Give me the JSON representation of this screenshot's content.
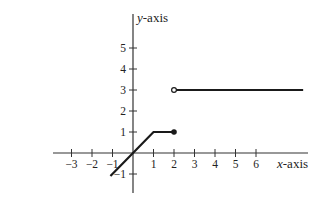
{
  "chart_data": {
    "type": "line",
    "title": "",
    "xlabel": "x-axis",
    "ylabel": "y-axis",
    "xlim": [
      -3.9,
      8.6
    ],
    "ylim": [
      -1.9,
      6.6
    ],
    "grid": false,
    "legend": null,
    "x_ticks": [
      -3,
      -2,
      -1,
      1,
      2,
      3,
      4,
      5,
      6
    ],
    "y_ticks": [
      -1,
      1,
      2,
      3,
      4,
      5
    ],
    "x_tick_labels": [
      "−3",
      "−2",
      "−1",
      "1",
      "2",
      "3",
      "4",
      "5",
      "6"
    ],
    "y_tick_labels": [
      "−1",
      "1",
      "2",
      "3",
      "4",
      "5"
    ],
    "series": [
      {
        "name": "piece-1",
        "description": "y = x for -1.1 <= x <= 1, then y = 1 for 1 <= x <= 2 (closed endpoint at x=2)",
        "points": [
          [
            -1.1,
            -1.1
          ],
          [
            0,
            0
          ],
          [
            1,
            1
          ],
          [
            2,
            1
          ]
        ],
        "end_marker": {
          "x": 2,
          "y": 1,
          "style": "closed"
        }
      },
      {
        "name": "piece-2",
        "description": "y = 3 for x > 2 (open endpoint at x=2)",
        "points": [
          [
            2,
            3
          ],
          [
            8.3,
            3
          ]
        ],
        "start_marker": {
          "x": 2,
          "y": 3,
          "style": "open"
        }
      }
    ],
    "colors": {
      "line": "#1a1a1a",
      "axis": "#333333"
    }
  }
}
